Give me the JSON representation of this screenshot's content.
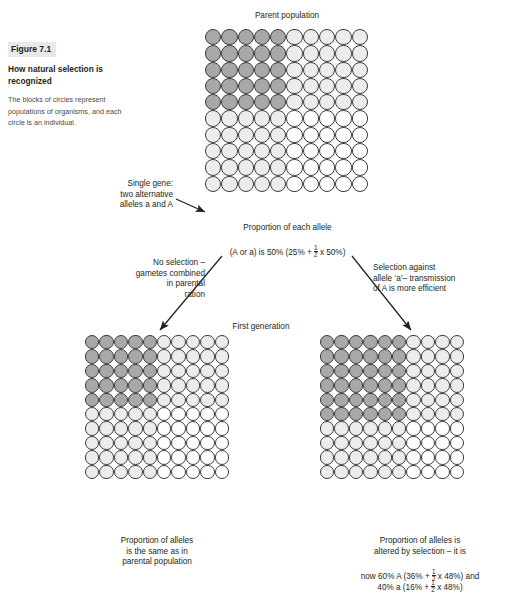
{
  "figure": {
    "number_label": "Figure 7.1",
    "title": "How natural selection is recognized",
    "description": "The blocks of circles represent populations of organisms, and each circle is an individual."
  },
  "parent": {
    "heading": "Parent population",
    "caption_line1": "Proportion of each allele",
    "caption_line2_pre": "(A or a) is 50% (25% + ",
    "caption_line2_post": " x 50%)"
  },
  "annotations": {
    "single_gene": "Single gene:\ntwo alternative\nalleles a and A",
    "branch_left": "No selection –\ngametes combined\nin parental\nration",
    "branch_right": "Selection against\nallele ‘a’– transmission\nof A is more efficient"
  },
  "first_generation": {
    "heading": "First generation",
    "left_caption": "Proportion of alleles\nis the same as in\nparental population",
    "right_caption_line1": "Proportion of alleles is",
    "right_caption_line2": "altered by selection – it is",
    "right_caption_line3_pre": "now 60% A (36% + ",
    "right_caption_line3_post": " x 48%) and",
    "right_caption_line4_pre": "40% a (16% + ",
    "right_caption_line4_post": " x 48%)"
  },
  "fraction": {
    "numerator": "1",
    "denominator": "2"
  },
  "colors": {
    "dark_circle": "#a8a8a8",
    "mid_circle": "#ececec",
    "light_circle": "#ffffff",
    "outline": "#3b3b3b",
    "text": "#231f20",
    "caption_body": "#4a4a4a",
    "figno_background": "#e9e9e9"
  },
  "grids": {
    "parent": {
      "rows": 10,
      "cols": 10,
      "cells": [
        [
          "dark",
          "dark",
          "dark",
          "dark",
          "dark",
          "mid",
          "mid",
          "mid",
          "mid",
          "mid"
        ],
        [
          "dark",
          "dark",
          "dark",
          "dark",
          "dark",
          "mid",
          "mid",
          "mid",
          "mid",
          "mid"
        ],
        [
          "dark",
          "dark",
          "dark",
          "dark",
          "dark",
          "mid",
          "mid",
          "mid",
          "mid",
          "mid"
        ],
        [
          "dark",
          "dark",
          "dark",
          "dark",
          "dark",
          "mid",
          "mid",
          "mid",
          "mid",
          "mid"
        ],
        [
          "dark",
          "dark",
          "dark",
          "dark",
          "dark",
          "mid",
          "mid",
          "mid",
          "mid",
          "mid"
        ],
        [
          "mid",
          "mid",
          "mid",
          "mid",
          "mid",
          "light",
          "light",
          "light",
          "light",
          "light"
        ],
        [
          "mid",
          "mid",
          "mid",
          "mid",
          "mid",
          "light",
          "light",
          "light",
          "light",
          "light"
        ],
        [
          "mid",
          "mid",
          "mid",
          "mid",
          "mid",
          "light",
          "light",
          "light",
          "light",
          "light"
        ],
        [
          "mid",
          "mid",
          "mid",
          "mid",
          "mid",
          "light",
          "light",
          "light",
          "light",
          "light"
        ],
        [
          "mid",
          "mid",
          "mid",
          "mid",
          "mid",
          "light",
          "light",
          "light",
          "light",
          "light"
        ]
      ]
    },
    "generation_left": {
      "rows": 10,
      "cols": 10,
      "cells": [
        [
          "dark",
          "dark",
          "dark",
          "dark",
          "dark",
          "mid",
          "mid",
          "mid",
          "mid",
          "mid"
        ],
        [
          "dark",
          "dark",
          "dark",
          "dark",
          "dark",
          "mid",
          "mid",
          "mid",
          "mid",
          "mid"
        ],
        [
          "dark",
          "dark",
          "dark",
          "dark",
          "dark",
          "mid",
          "mid",
          "mid",
          "mid",
          "mid"
        ],
        [
          "dark",
          "dark",
          "dark",
          "dark",
          "dark",
          "mid",
          "mid",
          "mid",
          "mid",
          "mid"
        ],
        [
          "dark",
          "dark",
          "dark",
          "dark",
          "dark",
          "mid",
          "mid",
          "mid",
          "mid",
          "mid"
        ],
        [
          "mid",
          "mid",
          "mid",
          "mid",
          "mid",
          "light",
          "light",
          "light",
          "light",
          "light"
        ],
        [
          "mid",
          "mid",
          "mid",
          "mid",
          "mid",
          "light",
          "light",
          "light",
          "light",
          "light"
        ],
        [
          "mid",
          "mid",
          "mid",
          "mid",
          "mid",
          "light",
          "light",
          "light",
          "light",
          "light"
        ],
        [
          "mid",
          "mid",
          "mid",
          "mid",
          "mid",
          "light",
          "light",
          "light",
          "light",
          "light"
        ],
        [
          "mid",
          "mid",
          "mid",
          "mid",
          "mid",
          "light",
          "light",
          "light",
          "light",
          "light"
        ]
      ]
    },
    "generation_right": {
      "rows": 10,
      "cols": 10,
      "cells": [
        [
          "dark",
          "dark",
          "dark",
          "dark",
          "dark",
          "dark",
          "mid",
          "mid",
          "mid",
          "mid"
        ],
        [
          "dark",
          "dark",
          "dark",
          "dark",
          "dark",
          "dark",
          "mid",
          "mid",
          "mid",
          "mid"
        ],
        [
          "dark",
          "dark",
          "dark",
          "dark",
          "dark",
          "dark",
          "mid",
          "mid",
          "mid",
          "mid"
        ],
        [
          "dark",
          "dark",
          "dark",
          "dark",
          "dark",
          "dark",
          "mid",
          "mid",
          "mid",
          "mid"
        ],
        [
          "dark",
          "dark",
          "dark",
          "dark",
          "dark",
          "dark",
          "mid",
          "mid",
          "mid",
          "mid"
        ],
        [
          "dark",
          "dark",
          "dark",
          "dark",
          "dark",
          "dark",
          "mid",
          "mid",
          "mid",
          "mid"
        ],
        [
          "mid",
          "mid",
          "mid",
          "mid",
          "mid",
          "mid",
          "light",
          "light",
          "light",
          "light"
        ],
        [
          "mid",
          "mid",
          "mid",
          "mid",
          "mid",
          "mid",
          "light",
          "light",
          "light",
          "light"
        ],
        [
          "mid",
          "mid",
          "mid",
          "mid",
          "mid",
          "mid",
          "light",
          "light",
          "light",
          "light"
        ],
        [
          "mid",
          "mid",
          "mid",
          "mid",
          "mid",
          "mid",
          "light",
          "light",
          "light",
          "light"
        ]
      ]
    }
  },
  "chart_data": {
    "type": "diagram",
    "title": "How natural selection is recognized",
    "populations": [
      {
        "name": "Parent population",
        "grid": "10x10",
        "AA_percent": 25,
        "Aa_percent": 50,
        "aa_percent": 25,
        "allele_A_percent": 50,
        "allele_a_percent": 50
      },
      {
        "name": "First generation - no selection",
        "grid": "10x10",
        "AA_percent": 25,
        "Aa_percent": 50,
        "aa_percent": 25,
        "allele_A_percent": 50,
        "allele_a_percent": 50
      },
      {
        "name": "First generation - selection against a",
        "grid": "10x10",
        "AA_percent": 36,
        "Aa_percent": 48,
        "aa_percent": 16,
        "allele_A_percent": 60,
        "allele_a_percent": 40
      }
    ]
  }
}
